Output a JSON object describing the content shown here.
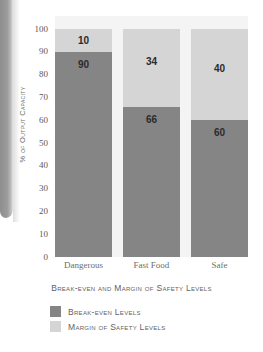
{
  "chart_data": {
    "type": "bar",
    "stacked": true,
    "title": "",
    "xlabel": "Break-even and Margin of Safety Levels",
    "ylabel": "% of Output Capacity",
    "categories": [
      "Dangerous",
      "Fast Food",
      "Safe"
    ],
    "ylim": [
      0,
      100
    ],
    "yticks": [
      100,
      90,
      80,
      70,
      60,
      50,
      40,
      30,
      20,
      10,
      0
    ],
    "grid": false,
    "legend_position": "below",
    "series": [
      {
        "name": "Break-even Levels",
        "color": "#858585",
        "values": [
          90,
          66,
          60
        ]
      },
      {
        "name": "Margin of Safety Levels",
        "color": "#d5d5d5",
        "values": [
          10,
          34,
          40
        ]
      }
    ],
    "plot_background": "#f4f4f4"
  },
  "legend": {
    "items": [
      {
        "label": "Break-even Levels",
        "color": "#858585"
      },
      {
        "label": "Margin of Safety Levels",
        "color": "#d5d5d5"
      }
    ]
  }
}
